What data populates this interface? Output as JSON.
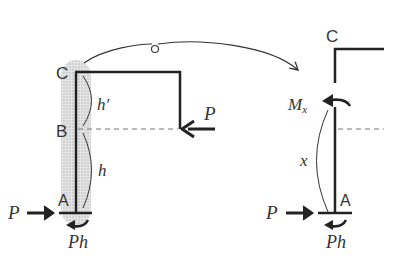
{
  "left_frame": {
    "labels": {
      "C": "C",
      "B": "B",
      "A": "A",
      "h_prime": "h′",
      "h": "h",
      "P_left": "P",
      "P_right": "P",
      "Ph": "Ph"
    }
  },
  "right_frame": {
    "labels": {
      "C": "C",
      "A": "A",
      "Mx_main": "M",
      "Mx_sub": "x",
      "x": "x",
      "P": "P",
      "Ph": "Ph"
    }
  },
  "colors": {
    "line": "#222222",
    "highlight": "#c8c8c8",
    "dash": "#777777",
    "text": "#333333"
  }
}
